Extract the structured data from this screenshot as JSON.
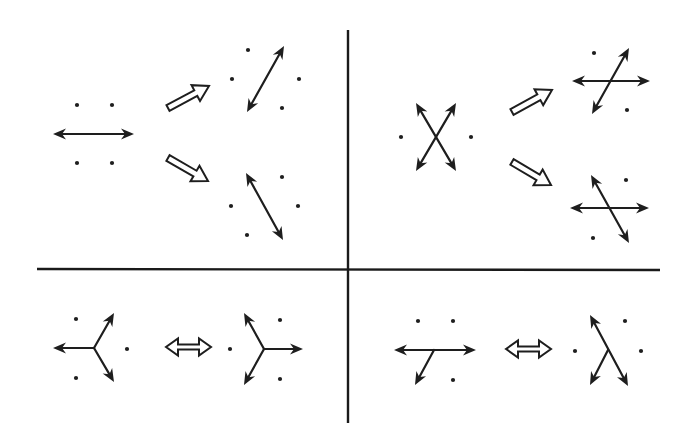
{
  "diagram": {
    "title": "",
    "colors": {
      "ink": "#1e1e1e",
      "background": "#ffffff"
    },
    "dividers": {
      "vertical": {
        "x1": 348,
        "y1": 30,
        "x2": 348,
        "y2": 423
      },
      "horizontal": {
        "x1": 37,
        "y1": 269,
        "x2": 660,
        "y2": 270
      }
    },
    "panels": [
      {
        "id": "top-left",
        "description": "Single horizontal double-headed arrow splits into two tilted double-headed arrows",
        "groups": [
          {
            "id": "tl-source",
            "dots": [
              [
                77,
                105
              ],
              [
                112,
                105
              ],
              [
                77,
                163
              ],
              [
                112,
                163
              ]
            ],
            "arrows": [
              {
                "from": [
                  53,
                  134
                ],
                "to": [
                  134,
                  134
                ],
                "double": true
              }
            ]
          },
          {
            "id": "tl-result-up",
            "dots": [
              [
                248,
                50
              ],
              [
                232,
                79
              ],
              [
                299,
                79
              ],
              [
                282,
                108
              ]
            ],
            "arrows": [
              {
                "from": [
                  247,
                  112
                ],
                "to": [
                  284,
                  46
                ],
                "double": true
              }
            ]
          },
          {
            "id": "tl-result-down",
            "dots": [
              [
                282,
                177
              ],
              [
                231,
                206
              ],
              [
                298,
                206
              ],
              [
                247,
                235
              ]
            ],
            "arrows": [
              {
                "from": [
                  246,
                  173
                ],
                "to": [
                  283,
                  240
                ],
                "double": true
              }
            ]
          }
        ],
        "transitions": [
          {
            "type": "hollow-single",
            "from": [
              168,
              108
            ],
            "to": [
              209,
              86
            ]
          },
          {
            "type": "hollow-single",
            "from": [
              168,
              158
            ],
            "to": [
              208,
              181
            ]
          }
        ]
      },
      {
        "id": "top-right",
        "description": "X-shaped crossing arrows transform into horizontal plus tilted crossings",
        "groups": [
          {
            "id": "tr-source",
            "dots": [
              [
                401,
                137
              ],
              [
                471,
                137
              ]
            ],
            "arrows": [
              {
                "from": [
                  416,
                  103
                ],
                "to": [
                  456,
                  171
                ],
                "double": true
              },
              {
                "from": [
                  456,
                  103
                ],
                "to": [
                  416,
                  171
                ],
                "double": true
              }
            ]
          },
          {
            "id": "tr-result-up",
            "dots": [
              [
                594,
                53
              ],
              [
                627,
                110
              ]
            ],
            "arrows": [
              {
                "from": [
                  572,
                  81
                ],
                "to": [
                  650,
                  81
                ],
                "double": true
              },
              {
                "from": [
                  592,
                  114
                ],
                "to": [
                  629,
                  48
                ],
                "double": true
              }
            ]
          },
          {
            "id": "tr-result-down",
            "dots": [
              [
                626,
                180
              ],
              [
                593,
                238
              ]
            ],
            "arrows": [
              {
                "from": [
                  570,
                  208
                ],
                "to": [
                  649,
                  208
                ],
                "double": true
              },
              {
                "from": [
                  591,
                  175
                ],
                "to": [
                  629,
                  243
                ],
                "double": true
              }
            ]
          }
        ],
        "transitions": [
          {
            "type": "hollow-single",
            "from": [
              512,
              112
            ],
            "to": [
              552,
              90
            ]
          },
          {
            "type": "hollow-single",
            "from": [
              512,
              162
            ],
            "to": [
              551,
              185
            ]
          }
        ]
      },
      {
        "id": "bottom-left",
        "description": "Three-way junction pointing left is equivalent to three-way junction pointing right",
        "groups": [
          {
            "id": "bl-left",
            "dots": [
              [
                76,
                319
              ],
              [
                127,
                349
              ],
              [
                76,
                378
              ]
            ],
            "junction": [
              94,
              348
            ],
            "arrows": [
              {
                "from": [
                  94,
                  348
                ],
                "to": [
                  53,
                  348
                ],
                "double": false
              },
              {
                "from": [
                  94,
                  348
                ],
                "to": [
                  114,
                  313
                ],
                "double": false
              },
              {
                "from": [
                  94,
                  348
                ],
                "to": [
                  114,
                  382
                ],
                "double": false
              }
            ]
          },
          {
            "id": "bl-right",
            "dots": [
              [
                230,
                349
              ],
              [
                280,
                320
              ],
              [
                280,
                379
              ]
            ],
            "junction": [
              264,
              349
            ],
            "arrows": [
              {
                "from": [
                  264,
                  349
                ],
                "to": [
                  303,
                  349
                ],
                "double": false
              },
              {
                "from": [
                  264,
                  349
                ],
                "to": [
                  244,
                  313
                ],
                "double": false
              },
              {
                "from": [
                  264,
                  349
                ],
                "to": [
                  244,
                  385
                ],
                "double": false
              }
            ]
          }
        ],
        "transitions": [
          {
            "type": "hollow-double",
            "from": [
              166,
              347
            ],
            "to": [
              211,
              347
            ]
          }
        ]
      },
      {
        "id": "bottom-right",
        "description": "T-like junction on horizontal line is equivalent to lambda-shaped junction",
        "groups": [
          {
            "id": "br-left",
            "dots": [
              [
                418,
                321
              ],
              [
                453,
                321
              ],
              [
                453,
                380
              ]
            ],
            "arrows": [
              {
                "from": [
                  394,
                  350
                ],
                "to": [
                  476,
                  350
                ],
                "double": true
              },
              {
                "from": [
                  434,
                  350
                ],
                "to": [
                  415,
                  385
                ],
                "double": false
              }
            ]
          },
          {
            "id": "br-right",
            "dots": [
              [
                575,
                351
              ],
              [
                625,
                321
              ],
              [
                641,
                351
              ]
            ],
            "arrows": [
              {
                "from": [
                  590,
                  315
                ],
                "to": [
                  628,
                  386
                ],
                "double": true
              },
              {
                "from": [
                  608,
                  350
                ],
                "to": [
                  590,
                  385
                ],
                "double": false
              }
            ]
          }
        ],
        "transitions": [
          {
            "type": "hollow-double",
            "from": [
              506,
              349
            ],
            "to": [
              551,
              349
            ]
          }
        ]
      }
    ]
  }
}
